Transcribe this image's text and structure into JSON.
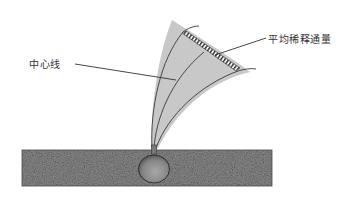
{
  "diagram": {
    "type": "plume-dispersion-schematic",
    "labels": {
      "centerline": "中心线",
      "average_dilution_flux": "平均稀释通量"
    },
    "colors": {
      "plume_fill": "#c8c8c8",
      "plume_outline": "#3a3a3a",
      "ground_fill": "#6e6e6e",
      "source_sphere": "#8a8a8a",
      "hatch": "#333333",
      "text": "#333333"
    },
    "elements": [
      {
        "name": "ground-layer",
        "shape": "textured rectangle"
      },
      {
        "name": "source-sphere",
        "shape": "sphere embedded in ground"
      },
      {
        "name": "plume",
        "shape": "curved fan rising and bending right"
      },
      {
        "name": "plume-centerline",
        "shape": "curve through middle of plume"
      },
      {
        "name": "flux-cross-section",
        "shape": "hatched band across plume top"
      }
    ]
  }
}
